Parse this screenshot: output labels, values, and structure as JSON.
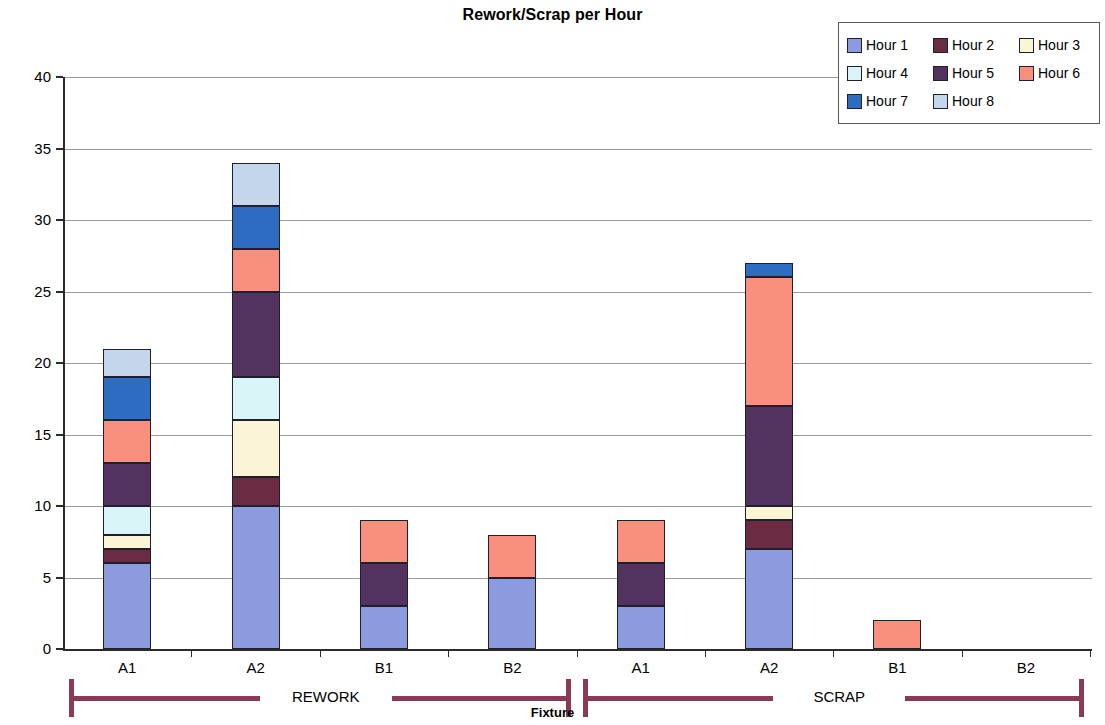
{
  "chart_data": {
    "type": "bar",
    "subtype": "stacked-bar",
    "title": "Rework/Scrap per Hour",
    "xlabel": "Fixture",
    "ylabel": "Number of Parts",
    "ylim": [
      0,
      40
    ],
    "ytick_labels": [
      "0",
      "5",
      "10",
      "15",
      "20",
      "25",
      "30",
      "35",
      "40"
    ],
    "ytick_values": [
      0,
      5,
      10,
      15,
      20,
      25,
      30,
      35,
      40
    ],
    "grid": true,
    "legend_position": "top-right",
    "categories": [
      "A1",
      "A2",
      "B1",
      "B2",
      "A1",
      "A2",
      "B1",
      "B2"
    ],
    "groups": [
      {
        "label": "REWORK",
        "start_index": 0,
        "end_index": 3
      },
      {
        "label": "SCRAP",
        "start_index": 4,
        "end_index": 7
      }
    ],
    "series": [
      {
        "name": "Hour 1",
        "color": "#8b9bde",
        "values": [
          6,
          10,
          3,
          5,
          3,
          7,
          0,
          0
        ]
      },
      {
        "name": "Hour 2",
        "color": "#6b2b42",
        "values": [
          1,
          2,
          0,
          0,
          0,
          2,
          0,
          0
        ]
      },
      {
        "name": "Hour 3",
        "color": "#faf5d5",
        "values": [
          1,
          4,
          0,
          0,
          0,
          1,
          0,
          0
        ]
      },
      {
        "name": "Hour 4",
        "color": "#d9f5f8",
        "values": [
          2,
          3,
          0,
          0,
          0,
          0,
          0,
          0
        ]
      },
      {
        "name": "Hour 5",
        "color": "#533260",
        "values": [
          3,
          6,
          3,
          0,
          3,
          7,
          0,
          0
        ]
      },
      {
        "name": "Hour 6",
        "color": "#f9907e",
        "values": [
          3,
          3,
          3,
          3,
          3,
          9,
          2,
          0
        ]
      },
      {
        "name": "Hour 7",
        "color": "#2d6cc0",
        "values": [
          3,
          3,
          0,
          0,
          0,
          1,
          0,
          0
        ]
      },
      {
        "name": "Hour 8",
        "color": "#c3d6ec",
        "values": [
          2,
          3,
          0,
          0,
          0,
          0,
          0,
          0
        ]
      }
    ],
    "totals": [
      21,
      34,
      9,
      8,
      9,
      27,
      2,
      0
    ]
  },
  "legend": {
    "items": [
      {
        "label": "Hour 1"
      },
      {
        "label": "Hour 2"
      },
      {
        "label": "Hour 3"
      },
      {
        "label": "Hour 4"
      },
      {
        "label": "Hour 5"
      },
      {
        "label": "Hour 6"
      },
      {
        "label": "Hour 7"
      },
      {
        "label": "Hour 8"
      }
    ]
  }
}
